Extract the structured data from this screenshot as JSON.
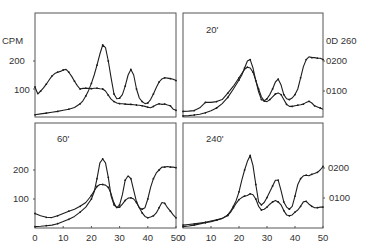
{
  "chart_data": [
    {
      "type": "line",
      "panel": "top-left",
      "title": "",
      "xlabel": "",
      "ylabel": "CPM",
      "xlim": [
        0,
        50
      ],
      "left_axis": {
        "label": "CPM",
        "ticks": [
          100,
          200
        ],
        "ylim": [
          0,
          370
        ]
      },
      "right_axis": {
        "ticks": [],
        "ylim": [
          0,
          0.35
        ]
      },
      "series": [
        {
          "name": "CPM (radioactivity)",
          "axis": "left",
          "x": [
            0,
            1,
            2,
            3,
            4,
            5,
            6,
            7,
            8,
            9,
            10,
            11,
            12,
            13,
            14,
            15,
            16,
            17,
            18,
            19,
            20,
            21,
            22,
            23,
            24,
            25,
            26,
            27,
            28,
            29,
            30,
            31,
            32,
            33,
            34,
            35,
            36,
            37,
            38,
            39,
            40,
            41,
            42,
            43,
            44,
            45,
            46,
            47,
            48,
            49,
            50
          ],
          "values": [
            107,
            82,
            92,
            104,
            117,
            132,
            146,
            155,
            160,
            163,
            168,
            170,
            160,
            145,
            128,
            112,
            100,
            102,
            103,
            102,
            101,
            103,
            103,
            101,
            100,
            93,
            78,
            64,
            55,
            50,
            48,
            47,
            46,
            45,
            45,
            44,
            43,
            42,
            40,
            38,
            35,
            33,
            38,
            44,
            47,
            45,
            46,
            43,
            40,
            28,
            24
          ]
        },
        {
          "name": "OD 260",
          "axis": "left",
          "x": [
            0,
            2,
            4,
            6,
            8,
            10,
            12,
            14,
            16,
            17,
            18,
            19,
            20,
            21,
            22,
            23,
            24,
            25,
            26,
            27,
            28,
            29,
            30,
            31,
            32,
            33,
            34,
            35,
            36,
            37,
            38,
            39,
            40,
            41,
            42,
            43,
            44,
            45,
            46,
            47,
            48,
            49,
            50
          ],
          "values": [
            8,
            11,
            14,
            17,
            20,
            24,
            28,
            34,
            47,
            58,
            75,
            95,
            120,
            150,
            185,
            225,
            257,
            248,
            200,
            140,
            82,
            65,
            67,
            80,
            110,
            150,
            170,
            150,
            100,
            68,
            55,
            48,
            50,
            62,
            82,
            105,
            125,
            136,
            140,
            139,
            137,
            135,
            130
          ]
        }
      ]
    },
    {
      "type": "line",
      "panel": "top-right",
      "title": "20'",
      "xlim": [
        0,
        50
      ],
      "right_axis": {
        "label": "OD 260",
        "ticks": [
          "0.100",
          "0.200"
        ],
        "top_label": "OD 260"
      },
      "series": [
        {
          "name": "CPM (radioactivity)",
          "x": [
            0,
            2,
            4,
            6,
            8,
            10,
            12,
            14,
            16,
            18,
            20,
            22,
            23,
            24,
            25,
            26,
            27,
            28,
            29,
            30,
            31,
            32,
            33,
            34,
            35,
            36,
            37,
            38,
            39,
            40,
            41,
            42,
            43,
            44,
            45,
            46,
            47,
            48,
            49,
            50
          ],
          "values": [
            20,
            21,
            23,
            33,
            52,
            52,
            55,
            62,
            85,
            110,
            140,
            170,
            178,
            175,
            160,
            130,
            100,
            72,
            57,
            55,
            62,
            72,
            82,
            86,
            80,
            62,
            45,
            38,
            38,
            40,
            42,
            44,
            46,
            52,
            56,
            50,
            40,
            36,
            32,
            28
          ]
        },
        {
          "name": "OD 260",
          "x": [
            0,
            2,
            4,
            6,
            8,
            10,
            12,
            14,
            16,
            18,
            20,
            21,
            22,
            23,
            24,
            25,
            26,
            27,
            28,
            29,
            30,
            31,
            32,
            33,
            34,
            35,
            36,
            37,
            38,
            39,
            40,
            41,
            42,
            43,
            44,
            45,
            46,
            47,
            48,
            49,
            50
          ],
          "values": [
            4,
            5,
            7,
            10,
            15,
            22,
            32,
            48,
            70,
            100,
            132,
            150,
            175,
            200,
            205,
            175,
            130,
            90,
            62,
            58,
            65,
            80,
            100,
            125,
            135,
            115,
            80,
            65,
            62,
            68,
            80,
            100,
            140,
            180,
            205,
            215,
            212,
            212,
            210,
            210,
            205
          ]
        }
      ]
    },
    {
      "type": "line",
      "panel": "bottom-left",
      "title": "60'",
      "xlabel": "",
      "ylabel": "",
      "xlim": [
        0,
        50
      ],
      "left_axis": {
        "ticks": [
          100,
          200
        ]
      },
      "x_ticks": [
        0,
        10,
        20,
        30,
        40,
        50
      ],
      "series": [
        {
          "name": "CPM (radioactivity)",
          "x": [
            0,
            2,
            4,
            6,
            8,
            10,
            12,
            14,
            16,
            18,
            20,
            21,
            22,
            23,
            24,
            25,
            26,
            27,
            28,
            29,
            30,
            31,
            32,
            33,
            34,
            35,
            36,
            37,
            38,
            39,
            40,
            41,
            42,
            43,
            44,
            45,
            46,
            47,
            48,
            49,
            50
          ],
          "values": [
            50,
            42,
            37,
            36,
            42,
            50,
            58,
            65,
            75,
            88,
            112,
            128,
            143,
            150,
            150,
            148,
            140,
            118,
            85,
            70,
            72,
            82,
            95,
            103,
            104,
            100,
            88,
            70,
            52,
            40,
            35,
            38,
            42,
            52,
            70,
            88,
            85,
            70,
            58,
            45,
            35
          ]
        },
        {
          "name": "OD 260",
          "x": [
            0,
            2,
            4,
            6,
            8,
            10,
            12,
            14,
            16,
            18,
            20,
            21,
            22,
            23,
            24,
            25,
            26,
            27,
            28,
            29,
            30,
            31,
            32,
            33,
            34,
            35,
            36,
            37,
            38,
            39,
            40,
            41,
            42,
            43,
            44,
            45,
            46,
            47,
            48,
            49,
            50
          ],
          "values": [
            5,
            6,
            8,
            10,
            15,
            22,
            30,
            40,
            55,
            72,
            100,
            125,
            170,
            225,
            238,
            225,
            175,
            110,
            80,
            70,
            80,
            115,
            165,
            180,
            170,
            130,
            90,
            70,
            65,
            70,
            100,
            140,
            170,
            190,
            200,
            210,
            210,
            212,
            210,
            210,
            208
          ]
        }
      ]
    },
    {
      "type": "line",
      "panel": "bottom-right",
      "title": "240'",
      "xlim": [
        0,
        50
      ],
      "right_axis": {
        "ticks": [
          "0.100",
          "0.200"
        ]
      },
      "x_ticks": [
        0,
        10,
        20,
        30,
        40,
        50
      ],
      "series": [
        {
          "name": "CPM (radioactivity)",
          "x": [
            0,
            2,
            4,
            6,
            8,
            10,
            12,
            14,
            16,
            17,
            18,
            19,
            20,
            21,
            22,
            23,
            24,
            25,
            26,
            27,
            28,
            29,
            30,
            31,
            32,
            33,
            34,
            35,
            36,
            37,
            38,
            39,
            40,
            41,
            42,
            43,
            44,
            45,
            46,
            47,
            48,
            49,
            50
          ],
          "values": [
            10,
            12,
            14,
            17,
            20,
            24,
            28,
            33,
            43,
            55,
            70,
            85,
            98,
            105,
            110,
            112,
            118,
            115,
            100,
            75,
            62,
            65,
            72,
            82,
            90,
            95,
            90,
            80,
            60,
            45,
            42,
            45,
            55,
            62,
            75,
            90,
            92,
            82,
            75,
            70,
            70,
            72,
            72
          ]
        },
        {
          "name": "OD 260",
          "x": [
            0,
            2,
            4,
            6,
            8,
            10,
            12,
            14,
            16,
            17,
            18,
            19,
            20,
            21,
            22,
            23,
            24,
            25,
            26,
            27,
            28,
            29,
            30,
            31,
            32,
            33,
            34,
            35,
            36,
            37,
            38,
            39,
            40,
            41,
            42,
            43,
            44,
            45,
            46,
            47,
            48,
            49,
            50
          ],
          "values": [
            5,
            7,
            10,
            14,
            18,
            22,
            27,
            33,
            45,
            58,
            75,
            95,
            125,
            165,
            200,
            230,
            250,
            215,
            150,
            90,
            80,
            88,
            105,
            125,
            145,
            165,
            165,
            130,
            90,
            72,
            65,
            75,
            110,
            150,
            170,
            180,
            182,
            180,
            185,
            188,
            192,
            200,
            212
          ]
        }
      ]
    }
  ],
  "figure": {
    "left_axis_label": "CPM",
    "right_axis_label": "OD 260",
    "left_ticks": [
      "100",
      "200"
    ],
    "right_ticks_top": [
      "0D 260",
      "0200",
      "0100"
    ],
    "right_ticks_bottom": [
      "0200",
      "0100"
    ],
    "x_tick_labels": [
      "0",
      "10",
      "20",
      "30",
      "40",
      "50"
    ],
    "panel_labels": {
      "top_right": "20'",
      "bottom_left": "60'",
      "bottom_right": "240'"
    }
  }
}
